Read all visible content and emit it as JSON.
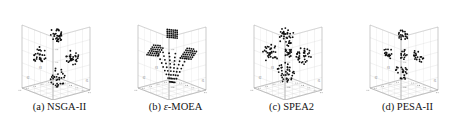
{
  "figure": {
    "type": "scatter3d-grid",
    "background": "#ffffff",
    "point_color": "#111111",
    "pane_color": "#fcfcfc",
    "grid_color": "#d8d8d8",
    "axis_color": "#9a9a9a",
    "tick_label_color": "#8d8d8d",
    "panel_count": 4
  },
  "panels": [
    {
      "id": "nsga-ii",
      "caption_prefix": "(a)",
      "caption_label": "NSGA-II",
      "caption_full": "(a) NSGA-II",
      "axis_labels": {
        "x": "f1",
        "y": "f2",
        "z": "f3"
      },
      "tick_labels": {
        "x": [
          "0.2",
          "0.4",
          "0.6",
          "0.8",
          "1"
        ],
        "y": [
          "0.2",
          "0.4",
          "0.6",
          "0.8",
          "1"
        ],
        "z": [
          "0.2",
          "0.4",
          "0.6",
          "0.8",
          "1"
        ]
      },
      "axis_ranges": {
        "x": [
          0,
          1
        ],
        "y": [
          0,
          1
        ],
        "z": [
          0,
          1
        ]
      },
      "cluster_style": "irregular-blobs",
      "cluster_count": 4,
      "point_count": 120
    },
    {
      "id": "eps-moea",
      "caption_prefix": "(b)",
      "caption_label": "-MOEA",
      "caption_symbol": "ε",
      "caption_full": "(b) ε-MOEA",
      "axis_labels": {
        "x": "f1",
        "y": "f2",
        "z": "f3"
      },
      "tick_labels": {
        "x": [
          "0.2",
          "0.4",
          "0.6",
          "0.8",
          "1"
        ],
        "y": [
          "0.2",
          "0.4",
          "0.6",
          "0.8",
          "1"
        ],
        "z": [
          "0.2",
          "0.4",
          "0.6",
          "0.8",
          "1"
        ]
      },
      "axis_ranges": {
        "x": [
          0,
          1
        ],
        "y": [
          0,
          1
        ],
        "z": [
          0,
          1
        ]
      },
      "cluster_style": "regular-lattice",
      "cluster_count": 4,
      "point_count": 150
    },
    {
      "id": "spea2",
      "caption_prefix": "(c)",
      "caption_label": "SPEA2",
      "caption_full": "(c) SPEA2",
      "axis_labels": {
        "x": "f1",
        "y": "f2",
        "z": "f3"
      },
      "tick_labels": {
        "x": [
          "0.2",
          "0.4",
          "0.6",
          "0.8",
          "1"
        ],
        "y": [
          "0.2",
          "0.4",
          "0.6",
          "0.8",
          "1"
        ],
        "z": [
          "0.2",
          "0.4",
          "0.6",
          "0.8",
          "1"
        ]
      },
      "axis_ranges": {
        "x": [
          0,
          1
        ],
        "y": [
          0,
          1
        ],
        "z": [
          0,
          1
        ]
      },
      "cluster_style": "dense-blobs",
      "cluster_count": 5,
      "point_count": 160
    },
    {
      "id": "pesa-ii",
      "caption_prefix": "(d)",
      "caption_label": "PESA-II",
      "caption_full": "(d) PESA-II",
      "axis_labels": {
        "x": "f1",
        "y": "f2",
        "z": "f3"
      },
      "tick_labels": {
        "x": [
          "0.2",
          "0.4",
          "0.6",
          "0.8",
          "1"
        ],
        "y": [
          "0.2",
          "0.4",
          "0.6",
          "0.8",
          "1"
        ],
        "z": [
          "0.2",
          "0.4",
          "0.6",
          "0.8",
          "1"
        ]
      },
      "axis_ranges": {
        "x": [
          0,
          1
        ],
        "y": [
          0,
          1
        ],
        "z": [
          0,
          1
        ]
      },
      "cluster_style": "sparse-blobs",
      "cluster_count": 5,
      "point_count": 95
    }
  ],
  "chart_data": {
    "type": "scatter",
    "title": "",
    "xlabel": "f1",
    "ylabel": "f2",
    "zlabel": "f3",
    "xlim": [
      0,
      1
    ],
    "ylim": [
      0,
      1
    ],
    "zlim": [
      0,
      1
    ],
    "grid": true,
    "legend": "none",
    "projection": "3d",
    "subplots": [
      {
        "name": "NSGA-II",
        "clusters": [
          {
            "cx": 0.5,
            "cy": 0.88,
            "spread": 0.075,
            "n": 32,
            "shape": "diamond"
          },
          {
            "cx": 0.18,
            "cy": 0.52,
            "spread": 0.07,
            "n": 28,
            "shape": "blob"
          },
          {
            "cx": 0.8,
            "cy": 0.52,
            "spread": 0.072,
            "n": 30,
            "shape": "blob"
          },
          {
            "cx": 0.52,
            "cy": 0.18,
            "spread": 0.08,
            "n": 30,
            "shape": "blob"
          }
        ]
      },
      {
        "name": "eps-MOEA",
        "clusters": [
          {
            "cx": 0.5,
            "cy": 0.9,
            "spread": 0.06,
            "n": 30,
            "shape": "lattice"
          },
          {
            "cx": 0.17,
            "cy": 0.58,
            "spread": 0.065,
            "n": 34,
            "shape": "lattice-diag"
          },
          {
            "cx": 0.81,
            "cy": 0.58,
            "spread": 0.065,
            "n": 34,
            "shape": "lattice-diag"
          },
          {
            "cx": 0.5,
            "cy": 0.22,
            "spread": 0.09,
            "n": 52,
            "shape": "lattice-fan"
          }
        ]
      },
      {
        "name": "SPEA2",
        "clusters": [
          {
            "cx": 0.47,
            "cy": 0.85,
            "spread": 0.08,
            "n": 34,
            "shape": "blob"
          },
          {
            "cx": 0.16,
            "cy": 0.55,
            "spread": 0.078,
            "n": 32,
            "shape": "blob"
          },
          {
            "cx": 0.8,
            "cy": 0.56,
            "spread": 0.076,
            "n": 34,
            "shape": "blob"
          },
          {
            "cx": 0.45,
            "cy": 0.26,
            "spread": 0.085,
            "n": 38,
            "shape": "blob"
          },
          {
            "cx": 0.5,
            "cy": 0.58,
            "spread": 0.05,
            "n": 18,
            "shape": "sparse"
          }
        ]
      },
      {
        "name": "PESA-II",
        "clusters": [
          {
            "cx": 0.48,
            "cy": 0.86,
            "spread": 0.07,
            "n": 20,
            "shape": "sparse"
          },
          {
            "cx": 0.17,
            "cy": 0.56,
            "spread": 0.075,
            "n": 20,
            "shape": "sparse"
          },
          {
            "cx": 0.78,
            "cy": 0.55,
            "spread": 0.075,
            "n": 20,
            "shape": "sparse"
          },
          {
            "cx": 0.46,
            "cy": 0.26,
            "spread": 0.09,
            "n": 22,
            "shape": "sparse"
          },
          {
            "cx": 0.5,
            "cy": 0.55,
            "spread": 0.06,
            "n": 13,
            "shape": "sparse"
          }
        ]
      }
    ]
  }
}
